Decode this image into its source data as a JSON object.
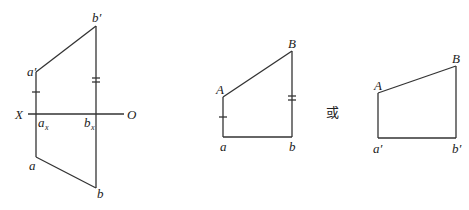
{
  "figure1": {
    "title": "projection",
    "labels": {
      "b_prime": "b′",
      "a_prime": "a′",
      "X": "X",
      "O": "O",
      "a_x": "a",
      "a_x_sub": "x",
      "b_x": "b",
      "b_x_sub": "x",
      "a": "a",
      "b": "b"
    }
  },
  "figure2": {
    "labels": {
      "A": "A",
      "B": "B",
      "a": "a",
      "b": "b"
    }
  },
  "separator": {
    "text": "或"
  },
  "figure3": {
    "labels": {
      "A": "A",
      "B": "B",
      "a_prime": "a′",
      "b_prime": "b′"
    }
  }
}
